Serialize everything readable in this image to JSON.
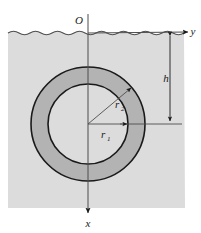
{
  "figure": {
    "type": "engineering-diagram",
    "width": 201,
    "height": 233
  },
  "labels": {
    "origin": "O",
    "y_axis": "y",
    "x_axis": "x",
    "depth": "h",
    "radius_outer_base": "r",
    "radius_outer_sub": "2",
    "radius_inner_base": "r",
    "radius_inner_sub": "1"
  },
  "geometry": {
    "center_x": 88,
    "center_y": 124,
    "outer_radius": 57,
    "inner_radius": 40,
    "water_line_y": 33,
    "fluid_left": 8,
    "fluid_right": 185,
    "fluid_bottom": 208,
    "depth_dim_x": 170,
    "radius_outer_angle_deg": 40
  },
  "colors": {
    "fluid_fill": "#dcdcdc",
    "annulus_fill": "#b3b3b3",
    "inner_fill": "#dcdcdc",
    "stroke": "#1a1a1a",
    "page_background": "#ffffff"
  }
}
